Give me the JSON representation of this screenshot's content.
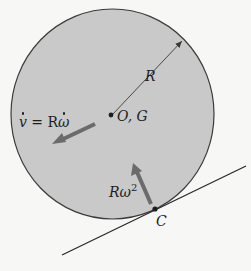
{
  "diagram": {
    "type": "rolling-disk-kinematics",
    "colors": {
      "background": "#f7f7f5",
      "disk_fill": "#c9c9c9",
      "outline": "#3a3a3a",
      "arrow": "#6b6b6b",
      "text": "#1e1e1e"
    },
    "labels": {
      "radius": "R",
      "center": "O, G",
      "acceleration_lhs": "v",
      "acceleration_eq": " = R",
      "acceleration_omega": "ω",
      "normal_accel_base": "Rω",
      "normal_accel_exp": "2",
      "contact_point": "C"
    }
  }
}
